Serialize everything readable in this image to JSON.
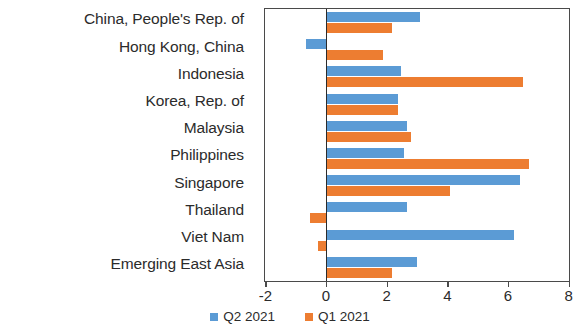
{
  "chart_data": {
    "type": "bar",
    "orientation": "horizontal",
    "title": "",
    "subtitle": "",
    "xlabel": "",
    "ylabel": "",
    "xlim": [
      -2,
      8
    ],
    "xticks": [
      -2,
      0,
      2,
      4,
      6,
      8
    ],
    "xtick_labels": [
      "-2",
      "0",
      "2",
      "4",
      "6",
      "8"
    ],
    "grid": false,
    "legend_position": "bottom-center",
    "categories": [
      "China, People's Rep. of",
      "Hong Kong, China",
      "Indonesia",
      "Korea, Rep. of",
      "Malaysia",
      "Philippines",
      "Singapore",
      "Thailand",
      "Viet Nam",
      "Emerging East Asia"
    ],
    "series": [
      {
        "name": "Q2 2021",
        "color": "#5b9bd5",
        "values": [
          3.1,
          -0.65,
          2.5,
          2.4,
          2.7,
          2.6,
          6.4,
          2.7,
          6.2,
          3.0
        ]
      },
      {
        "name": "Q1 2021",
        "color": "#ed7d31",
        "values": [
          2.2,
          1.9,
          6.5,
          2.4,
          2.8,
          6.7,
          4.1,
          -0.5,
          -0.25,
          2.2
        ]
      }
    ]
  },
  "legend": {
    "items": [
      {
        "label": "Q2 2021",
        "color": "#5b9bd5"
      },
      {
        "label": "Q1 2021",
        "color": "#ed7d31"
      }
    ]
  }
}
